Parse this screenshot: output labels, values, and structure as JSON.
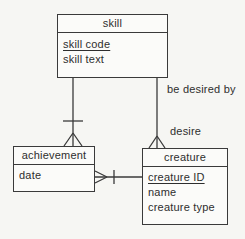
{
  "diagram": {
    "type": "entity-relationship",
    "notation": "crow's foot",
    "colors": {
      "background": "#f6f6f3",
      "line": "#3a3a3a",
      "box_fill": "#fbfbf9",
      "text": "#2e2e2e"
    }
  },
  "entities": {
    "skill": {
      "title": "skill",
      "attributes": [
        {
          "text": "skill code",
          "is_key": true
        },
        {
          "text": "skill text",
          "is_key": false
        }
      ]
    },
    "achievement": {
      "title": "achievement",
      "attributes": [
        {
          "text": "date",
          "is_key": false
        }
      ]
    },
    "creature": {
      "title": "creature",
      "attributes": [
        {
          "text": "creature ID",
          "is_key": true
        },
        {
          "text": "name",
          "is_key": false
        },
        {
          "text": "creature type",
          "is_key": false
        }
      ]
    }
  },
  "relationships": {
    "skill_creature": {
      "labels": [
        "be desired by",
        "desire"
      ],
      "skill_end": "plain",
      "creature_end": "many (crow's foot)"
    },
    "skill_achievement": {
      "skill_end": "one (bar)",
      "achievement_end": "many (crow's foot)"
    },
    "achievement_creature": {
      "achievement_end": "many (crow's foot)",
      "creature_end": "one (bar)"
    }
  }
}
